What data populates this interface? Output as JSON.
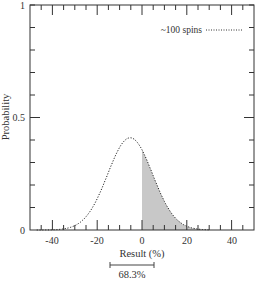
{
  "chart_data": {
    "type": "area",
    "title": "",
    "xlabel": "Result (%)",
    "ylabel": "Probability",
    "xlim": [
      -50,
      50
    ],
    "ylim": [
      0,
      1
    ],
    "x_ticks": [
      -40,
      -20,
      0,
      20,
      40
    ],
    "x_tick_labels": [
      "-40",
      "-20",
      "0",
      "20",
      "40"
    ],
    "y_ticks": [
      0,
      0.5,
      1
    ],
    "y_tick_labels": [
      "0",
      "0.5",
      "1"
    ],
    "grid": false,
    "legend": {
      "position": "upper right",
      "entries": [
        {
          "label": "~100 spins",
          "style": "dotted"
        }
      ]
    },
    "series": [
      {
        "name": "~100 spins",
        "distribution": "normal",
        "mean": -5.3,
        "std": 10,
        "peak_probability": 0.41,
        "x": [
          -45,
          -40,
          -35,
          -30,
          -25,
          -20,
          -15,
          -10,
          -5.3,
          0,
          5,
          10,
          15,
          20,
          25,
          30
        ],
        "y": [
          0.0,
          0.01,
          0.03,
          0.07,
          0.14,
          0.24,
          0.33,
          0.39,
          0.41,
          0.36,
          0.25,
          0.15,
          0.07,
          0.03,
          0.01,
          0.0
        ]
      }
    ],
    "shaded_region": {
      "from": 0,
      "to": 30,
      "color": "#c8c8c8"
    },
    "annotations": [
      {
        "type": "bracket",
        "from": -14,
        "to": 5,
        "label": "68.3%"
      }
    ]
  },
  "labels": {
    "xlabel": "Result (%)",
    "ylabel": "Probability",
    "legend": "~100 spins",
    "bracket": "68.3%",
    "x0": "-40",
    "x1": "-20",
    "x2": "0",
    "x3": "20",
    "x4": "40",
    "y0": "0",
    "y1": "0.5",
    "y2": "1"
  },
  "colors": {
    "frame": "#333333",
    "curve": "#222222",
    "shade": "#c8c8c8"
  }
}
